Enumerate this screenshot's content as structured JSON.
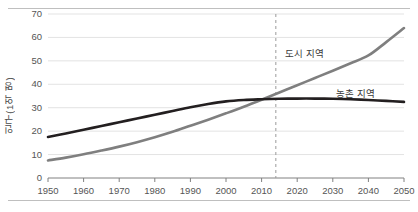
{
  "chart_data": {
    "type": "line",
    "title": "",
    "xlabel": "",
    "ylabel": "인구(1억 명)",
    "xlim": [
      1950,
      2050
    ],
    "ylim": [
      0,
      70
    ],
    "ytick_step": 10,
    "grid": true,
    "legend_position": "inline-annotation",
    "x_ticks": [
      "1950",
      "1960",
      "1970",
      "1980",
      "1990",
      "2000",
      "2010",
      "2020",
      "2030",
      "2040",
      "2050"
    ],
    "y_ticks": [
      "0",
      "10",
      "20",
      "30",
      "40",
      "50",
      "60",
      "70"
    ],
    "x": [
      1950,
      1955,
      1960,
      1965,
      1970,
      1975,
      1980,
      1985,
      1990,
      1995,
      2000,
      2005,
      2010,
      2015,
      2020,
      2025,
      2030,
      2035,
      2040,
      2045,
      2050
    ],
    "series": [
      {
        "name": "농촌 지역",
        "color": "#231f20",
        "style": "solid",
        "values": [
          17.5,
          19.0,
          20.6,
          22.2,
          23.8,
          25.4,
          27.0,
          28.6,
          30.2,
          31.6,
          32.7,
          33.3,
          33.6,
          33.8,
          33.9,
          33.9,
          33.8,
          33.6,
          33.3,
          32.9,
          32.5
        ]
      },
      {
        "name": "도시 지역",
        "color": "#7f7f7f",
        "style": "solid",
        "values": [
          7.5,
          8.7,
          10.1,
          11.7,
          13.4,
          15.3,
          17.4,
          19.7,
          22.3,
          24.9,
          27.6,
          30.4,
          33.4,
          36.5,
          39.6,
          42.7,
          45.8,
          49.0,
          52.3,
          58.0,
          64.0
        ]
      }
    ],
    "annotations": [
      {
        "name": "urban-series-label",
        "text": "도시 지역",
        "x": 285,
        "y": 46
      },
      {
        "name": "rural-series-label",
        "text": "농촌 지역",
        "x": 336,
        "y": 86
      }
    ],
    "reference_line": {
      "name": "year-2014-marker",
      "x_value": 2014,
      "style": "dashed",
      "color": "#9a9a9a"
    }
  }
}
